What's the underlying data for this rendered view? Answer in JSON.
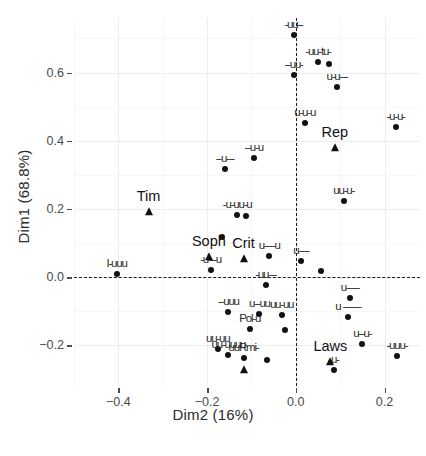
{
  "chart_data": {
    "type": "scatter",
    "title": "",
    "xlabel": "Dim2 (16%)",
    "ylabel": "Dim1 (68.8%)",
    "xlim": [
      -0.5,
      0.28
    ],
    "ylim": [
      -0.32,
      0.76
    ],
    "xticks": [
      -0.4,
      -0.2,
      0.0,
      0.2
    ],
    "xticklabels": [
      "-0.4",
      "-0.2",
      "0.0",
      "0.2"
    ],
    "yticks": [
      0.6,
      0.4,
      0.2,
      0.0,
      -0.2
    ],
    "yticklabels": [
      "0.6",
      "0.4",
      "0.2",
      "0.0",
      "-0.2"
    ],
    "grid": true,
    "legend": "none",
    "reference_lines": {
      "vertical_x": 0.0,
      "horizontal_y": 0.0,
      "style": "dashed"
    },
    "series": [
      {
        "name": "individuals",
        "marker": "circle",
        "color": "#111111",
        "points": [
          {
            "x": -0.005,
            "y": 0.71,
            "label": "-uu--"
          },
          {
            "x": 0.05,
            "y": 0.632,
            "label": "-uu-tu-"
          },
          {
            "x": 0.075,
            "y": 0.625,
            "label": ""
          },
          {
            "x": -0.005,
            "y": 0.592,
            "label": "--uu-"
          },
          {
            "x": 0.093,
            "y": 0.558,
            "label": "u-u---"
          },
          {
            "x": 0.02,
            "y": 0.452,
            "label": "u-u-u"
          },
          {
            "x": 0.225,
            "y": 0.44,
            "label": "-u-u-"
          },
          {
            "x": -0.095,
            "y": 0.348,
            "label": "--u-u"
          },
          {
            "x": -0.16,
            "y": 0.318,
            "label": "--u---"
          },
          {
            "x": 0.108,
            "y": 0.222,
            "label": "uu-u-"
          },
          {
            "x": -0.132,
            "y": 0.182,
            "label": "-u-uu-u"
          },
          {
            "x": -0.112,
            "y": 0.178,
            "label": ""
          },
          {
            "x": -0.166,
            "y": 0.118,
            "label": ""
          },
          {
            "x": -0.404,
            "y": 0.01,
            "label": "I-uuu"
          },
          {
            "x": -0.192,
            "y": 0.02,
            "label": "-u---u"
          },
          {
            "x": -0.06,
            "y": 0.062,
            "label": "u----u"
          },
          {
            "x": 0.012,
            "y": 0.048,
            "label": "u----"
          },
          {
            "x": 0.056,
            "y": 0.018,
            "label": ""
          },
          {
            "x": -0.068,
            "y": -0.022,
            "label": "-uu---"
          },
          {
            "x": 0.122,
            "y": -0.062,
            "label": "u-----"
          },
          {
            "x": -0.152,
            "y": -0.102,
            "label": "--uuu"
          },
          {
            "x": -0.082,
            "y": -0.108,
            "label": "u--uu"
          },
          {
            "x": -0.032,
            "y": -0.112,
            "label": "uu-uu"
          },
          {
            "x": 0.118,
            "y": -0.118,
            "label": "u -------"
          },
          {
            "x": -0.104,
            "y": -0.152,
            "label": "Pol-u"
          },
          {
            "x": -0.024,
            "y": -0.156,
            "label": ""
          },
          {
            "x": 0.15,
            "y": -0.198,
            "label": "u--u-"
          },
          {
            "x": -0.176,
            "y": -0.212,
            "label": "uu-uu"
          },
          {
            "x": -0.152,
            "y": -0.228,
            "label": "uu-uuuu"
          },
          {
            "x": -0.118,
            "y": -0.238,
            "label": "uuRmi-"
          },
          {
            "x": 0.228,
            "y": -0.232,
            "label": "-uuu-"
          },
          {
            "x": -0.064,
            "y": -0.244,
            "label": ""
          },
          {
            "x": 0.085,
            "y": -0.272,
            "label": "-u-"
          }
        ]
      },
      {
        "name": "supplementary-variables",
        "marker": "triangle",
        "color": "#111111",
        "points": [
          {
            "x": 0.088,
            "y": 0.378,
            "label": "Rep"
          },
          {
            "x": -0.332,
            "y": 0.192,
            "label": "Tim"
          },
          {
            "x": -0.196,
            "y": 0.06,
            "label": "Soph"
          },
          {
            "x": -0.118,
            "y": 0.052,
            "label": "Crit"
          },
          {
            "x": 0.078,
            "y": -0.25,
            "label": "Laws"
          },
          {
            "x": -0.118,
            "y": -0.272,
            "label": ""
          }
        ]
      }
    ],
    "named_labels": [
      "Tim",
      "Soph",
      "Crit",
      "Rep",
      "Pol",
      "Laws"
    ]
  },
  "axes": {
    "x_title": "Dim2 (16%)",
    "y_title": "Dim1 (68.8%)"
  }
}
